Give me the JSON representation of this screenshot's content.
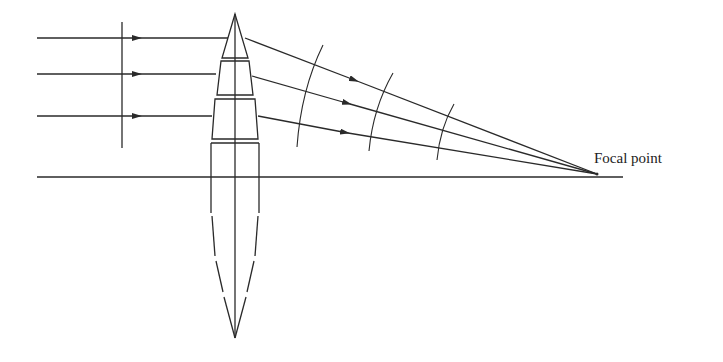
{
  "diagram": {
    "labels": {
      "focal_point": "Focal point"
    },
    "colors": {
      "line": "#2a2a2a",
      "background": "#ffffff"
    },
    "incoming_rays": [
      {
        "y": 38
      },
      {
        "y": 74
      },
      {
        "y": 116
      }
    ],
    "refracted_rays": [
      {
        "from": [
          245,
          38
        ],
        "to": [
          597,
          174
        ]
      },
      {
        "from": [
          252,
          76
        ],
        "to": [
          597,
          174
        ]
      },
      {
        "from": [
          258,
          116
        ],
        "to": [
          597,
          174
        ]
      }
    ],
    "optical_axis": {
      "y": 177,
      "x_start": 37,
      "x_end": 623
    },
    "focal_point": {
      "x": 597,
      "y": 174
    },
    "wavefronts": [
      {
        "name": "incoming-plane-wavefront",
        "type": "plane"
      },
      {
        "name": "converging-wavefront-1",
        "type": "spherical"
      },
      {
        "name": "converging-wavefront-2",
        "type": "spherical"
      },
      {
        "name": "converging-wavefront-3",
        "type": "spherical"
      }
    ],
    "lens": {
      "segments": [
        "prism-top-triangle",
        "prism-trapezoid-2",
        "prism-trapezoid-3",
        "prism-rectangle-4"
      ],
      "lower_half": "dashed"
    }
  }
}
